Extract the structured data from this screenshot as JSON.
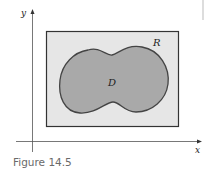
{
  "figure": {
    "caption": "Figure 14.5",
    "axis_labels": {
      "x": "x",
      "y": "y"
    },
    "region_labels": {
      "rectangle": "R",
      "domain": "D"
    },
    "colors": {
      "rectangle_fill": "#e6e6e6",
      "domain_fill": "#a9a9a9",
      "outline": "#333333",
      "axis": "#555555",
      "caption": "#6a6a6a"
    }
  }
}
